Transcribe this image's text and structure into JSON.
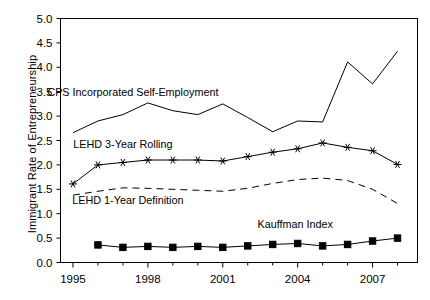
{
  "chart_data": {
    "type": "line",
    "title": "",
    "xlabel": "",
    "ylabel": "Immigrant Rate of Entrepreneurship",
    "xlim": [
      1994.5,
      2008.8
    ],
    "ylim": [
      0.0,
      5.0
    ],
    "grid": false,
    "legend_position": "inline-annotations",
    "y_ticks": [
      "0.0",
      "0.5",
      "1.0",
      "1.5",
      "2.0",
      "2.5",
      "3.0",
      "3.5",
      "4.0",
      "4.5",
      "5.0"
    ],
    "y_tick_values": [
      0.0,
      0.5,
      1.0,
      1.5,
      2.0,
      2.5,
      3.0,
      3.5,
      4.0,
      4.5,
      5.0
    ],
    "x_ticks": [
      "1995",
      "1998",
      "2001",
      "2004",
      "2007"
    ],
    "x_tick_values": [
      1995,
      1998,
      2001,
      2004,
      2007
    ],
    "x_minor_tick_values": [
      1996,
      1997,
      1999,
      2000,
      2002,
      2003,
      2005,
      2006,
      2008
    ],
    "series": [
      {
        "name": "CPS Incorporated Self-Employment",
        "label": "CPS Incorporated Self-Employment",
        "marker": "none",
        "dash": "solid",
        "color": "#000000",
        "label_x": 1997.4,
        "label_y": 3.42,
        "x": [
          1995,
          1996,
          1997,
          1998,
          1999,
          2000,
          2001,
          2002,
          2003,
          2004,
          2005,
          2006,
          2007,
          2008
        ],
        "values": [
          2.66,
          2.9,
          3.03,
          3.27,
          3.11,
          3.03,
          3.25,
          2.97,
          2.68,
          2.9,
          2.88,
          4.11,
          3.66,
          4.33
        ]
      },
      {
        "name": "LEHD 3-Year Rolling",
        "label": "LEHD 3-Year Rolling",
        "marker": "asterisk",
        "dash": "solid",
        "color": "#000000",
        "label_x": 1997.0,
        "label_y": 2.34,
        "x": [
          1995,
          1996,
          1997,
          1998,
          1999,
          2000,
          2001,
          2002,
          2003,
          2004,
          2005,
          2006,
          2007,
          2008
        ],
        "values": [
          1.61,
          2.0,
          2.05,
          2.1,
          2.1,
          2.1,
          2.08,
          2.17,
          2.26,
          2.33,
          2.45,
          2.36,
          2.29,
          2.01
        ]
      },
      {
        "name": "LEHD 1-Year Definition",
        "label": "LEHD 1-Year Definition",
        "marker": "none",
        "dash": "dashed",
        "color": "#000000",
        "label_x": 1997.2,
        "label_y": 1.2,
        "x": [
          1995,
          1996,
          1997,
          1998,
          1999,
          2000,
          2001,
          2002,
          2003,
          2004,
          2005,
          2006,
          2007,
          2008
        ],
        "values": [
          1.38,
          1.46,
          1.53,
          1.52,
          1.5,
          1.48,
          1.46,
          1.52,
          1.62,
          1.7,
          1.73,
          1.68,
          1.5,
          1.21
        ]
      },
      {
        "name": "Kauffman Index",
        "label": "Kauffman Index",
        "marker": "square",
        "dash": "solid",
        "color": "#000000",
        "label_x": 2003.9,
        "label_y": 0.7,
        "x": [
          1996,
          1997,
          1998,
          1999,
          2000,
          2001,
          2002,
          2003,
          2004,
          2005,
          2006,
          2007,
          2008
        ],
        "values": [
          0.36,
          0.31,
          0.33,
          0.31,
          0.33,
          0.31,
          0.34,
          0.37,
          0.39,
          0.34,
          0.37,
          0.44,
          0.5
        ]
      }
    ]
  }
}
